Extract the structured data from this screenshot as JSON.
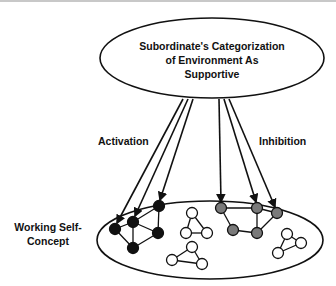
{
  "diagram": {
    "top_node": {
      "lines": [
        "Subordinate's Categorization",
        "of Environment As",
        "Supportive"
      ]
    },
    "labels": {
      "activation": "Activation",
      "inhibition": "Inhibition",
      "working_self_concept_line1": "Working Self-",
      "working_self_concept_line2": "Concept"
    },
    "colors": {
      "activated_node": "#111111",
      "inhibited_node": "#7a7a7a",
      "inactive_node": "#ffffff",
      "stroke": "#111111"
    }
  }
}
